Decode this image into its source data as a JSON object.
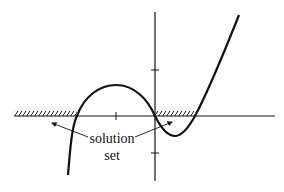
{
  "diagram": {
    "label_line1": "solution",
    "label_line2": "set",
    "colors": {
      "stroke": "#111111",
      "background": "#ffffff"
    }
  }
}
